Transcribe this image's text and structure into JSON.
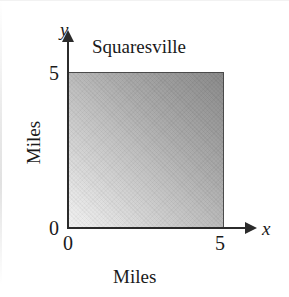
{
  "figure": {
    "title": "Squaresville",
    "background_color": "#ffffff"
  },
  "axes": {
    "x": {
      "name": "x",
      "label": "Miles",
      "ticks": [
        "0",
        "5"
      ],
      "min": 0,
      "max": 5,
      "arrow": "right"
    },
    "y": {
      "name": "y",
      "label": "Miles",
      "ticks": [
        "0",
        "5"
      ],
      "min": 0,
      "max": 5,
      "arrow": "up"
    }
  },
  "chart_data": {
    "type": "area",
    "title": "Squaresville",
    "xlabel": "Miles",
    "ylabel": "Miles",
    "xlim": [
      0,
      5
    ],
    "ylim": [
      0,
      5
    ],
    "xticks": [
      0,
      5
    ],
    "yticks": [
      0,
      5
    ],
    "xtick_labels": [
      "0",
      "5"
    ],
    "ytick_labels": [
      "0",
      "5"
    ],
    "grid": false,
    "legend": null,
    "axis_variable_labels": {
      "x": "x",
      "y": "y"
    },
    "regions": [
      {
        "name": "Squaresville",
        "shape": "square",
        "x_range": [
          0,
          5
        ],
        "y_range": [
          0,
          5
        ],
        "width": 5,
        "height": 5,
        "area": 25,
        "units": "Miles",
        "fill": "gradient",
        "gradient": {
          "direction": "bottom-left to top-right",
          "from_color": "#f2f2f2",
          "to_color": "#878787"
        },
        "border_color": "#4a4a4a"
      }
    ]
  },
  "colors": {
    "axis": "#2b2b2b",
    "text": "#1a1a1a",
    "region_border": "#4a4a4a",
    "region_light": "#f2f2f2",
    "region_dark": "#878787"
  }
}
